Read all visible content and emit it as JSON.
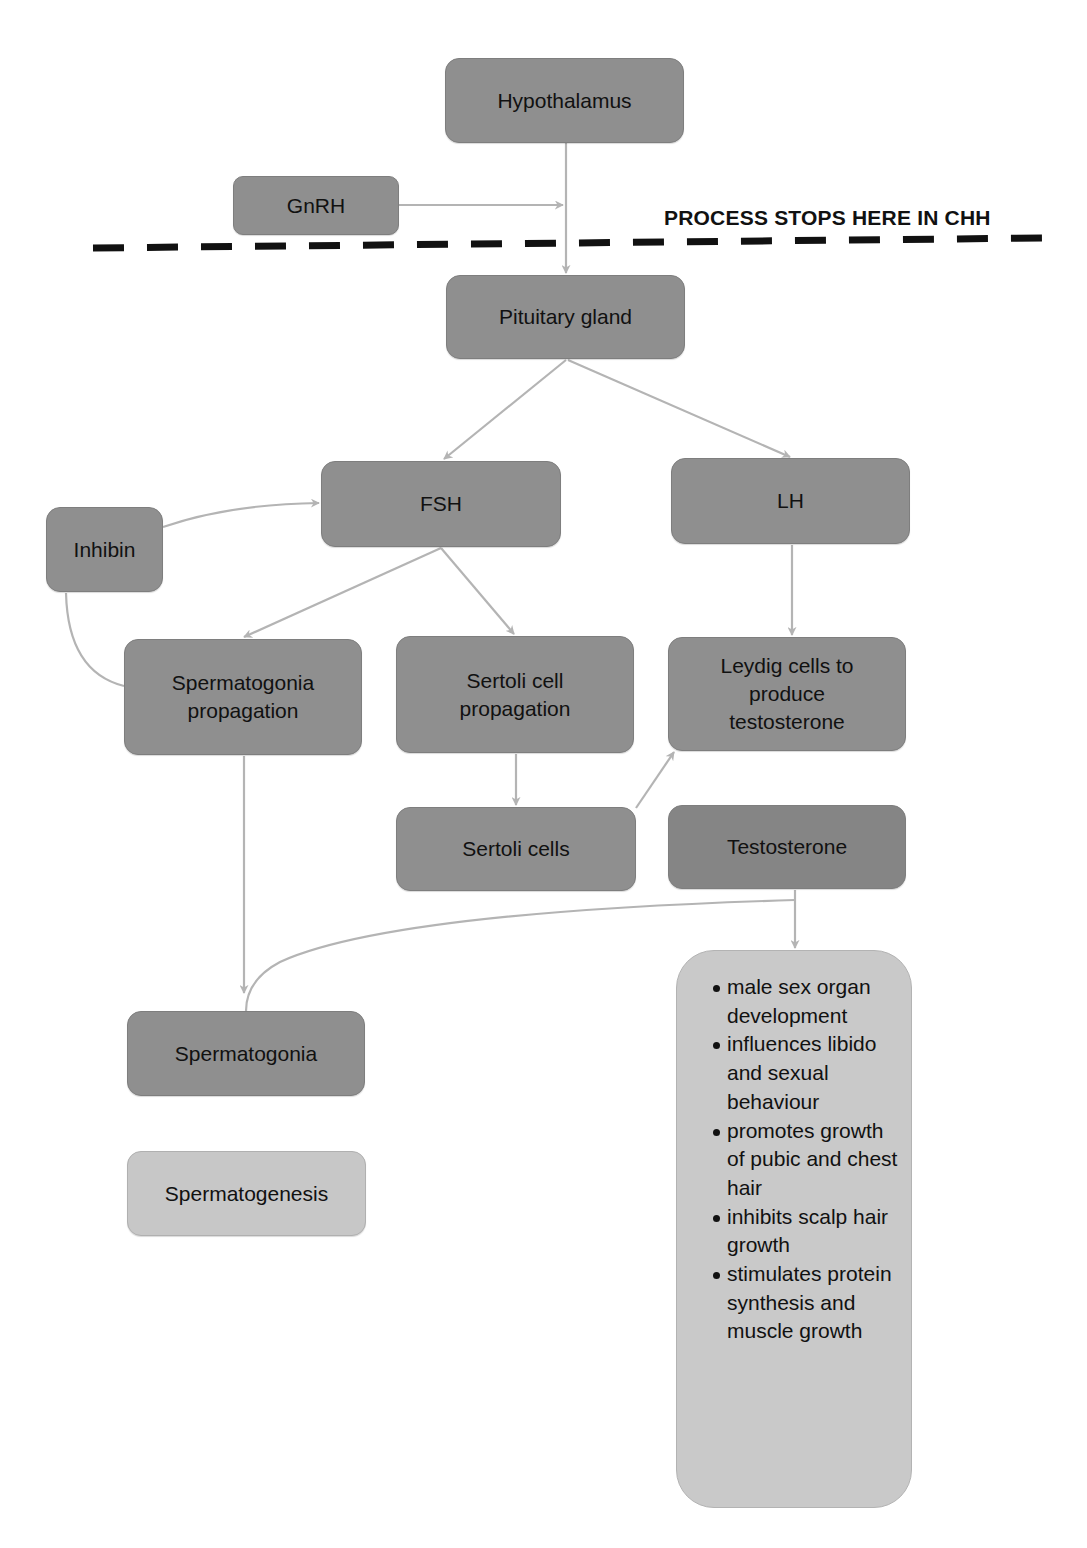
{
  "diagram": {
    "banner": "PROCESS STOPS HERE IN CHH",
    "colors": {
      "node_dark": "#8f8f8f",
      "node_darker": "#858585",
      "node_light": "#c7c7c7",
      "edge": "#b4b4b4",
      "dashed_line": "#111111"
    },
    "nodes": {
      "hypothalamus": "Hypothalamus",
      "gnrh": "GnRH",
      "pituitary": "Pituitary gland",
      "fsh": "FSH",
      "lh": "LH",
      "inhibin": "Inhibin",
      "spermatogonia_propagation": "Spermatogonia propagation",
      "sertoli_cell_propagation": "Sertoli cell propagation",
      "leydig": "Leydig cells to produce testosterone",
      "sertoli_cells": "Sertoli cells",
      "testosterone": "Testosterone",
      "spermatogonia": "Spermatogonia",
      "spermatogenesis": "Spermatogenesis"
    },
    "testosterone_effects": [
      "male sex organ development",
      "influences libido and sexual behaviour",
      "promotes growth of pubic and chest hair",
      "inhibits scalp hair growth",
      "stimulates protein synthesis and muscle growth"
    ],
    "edges": [
      {
        "from": "hypothalamus",
        "to": "pituitary"
      },
      {
        "from": "gnrh",
        "to": "hypothalamus-pituitary-line"
      },
      {
        "from": "pituitary",
        "to": "fsh"
      },
      {
        "from": "pituitary",
        "to": "lh"
      },
      {
        "from": "inhibin",
        "to": "fsh"
      },
      {
        "from": "spermatogonia_propagation",
        "to": "inhibin",
        "arrow": false
      },
      {
        "from": "fsh",
        "to": "spermatogonia_propagation"
      },
      {
        "from": "fsh",
        "to": "sertoli_cell_propagation"
      },
      {
        "from": "lh",
        "to": "leydig"
      },
      {
        "from": "sertoli_cell_propagation",
        "to": "sertoli_cells"
      },
      {
        "from": "sertoli_cells",
        "to": "leydig"
      },
      {
        "from": "spermatogonia_propagation",
        "to": "spermatogonia"
      },
      {
        "from": "testosterone",
        "to": "testosterone_effects"
      },
      {
        "from": "testosterone",
        "to": "spermatogonia",
        "arrow": false
      },
      {
        "from": "spermatogonia",
        "to": "spermatogenesis"
      }
    ]
  }
}
